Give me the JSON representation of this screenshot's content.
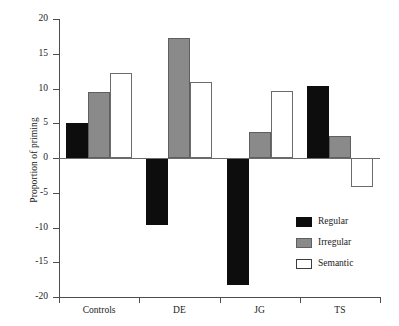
{
  "chart_data": {
    "type": "bar",
    "title": "",
    "subtitle": "",
    "xlabel": "",
    "ylabel": "Proportion of priming",
    "categories": [
      "Controls",
      "DE",
      "JG",
      "TS"
    ],
    "series": [
      {
        "name": "Regular",
        "color": "#0d0d0d",
        "values": [
          5.0,
          -9.6,
          -18.3,
          10.3
        ]
      },
      {
        "name": "Irregular",
        "color": "#8a8a8a",
        "values": [
          9.5,
          17.3,
          3.8,
          3.2
        ]
      },
      {
        "name": "Semantic",
        "color": "#ffffff",
        "values": [
          12.3,
          11.0,
          9.7,
          -4.2
        ]
      }
    ],
    "ylim": [
      -20,
      20
    ],
    "yticks": [
      20,
      15,
      10,
      5,
      0,
      -5,
      -10,
      -15,
      -20
    ],
    "ytick_labels": [
      "20",
      "15",
      "10",
      "5",
      "0",
      "-5",
      "-10",
      "-15",
      "-20"
    ],
    "grid": false,
    "legend_position": "inside-bottom-right",
    "zero_line": true
  },
  "legend": {
    "entries": [
      {
        "label": "Regular",
        "swatch": "black-filled-swatch"
      },
      {
        "label": "Irregular",
        "swatch": "gray-filled-swatch"
      },
      {
        "label": "Semantic",
        "swatch": "white-outlined-swatch"
      }
    ]
  },
  "axes": {
    "y_title": "Proportion of priming",
    "y_tick_labels": [
      "20",
      "15",
      "10",
      "5",
      "0",
      "-5",
      "-10",
      "-15",
      "-20"
    ],
    "x_tick_labels": [
      "Controls",
      "DE",
      "JG",
      "TS"
    ]
  }
}
